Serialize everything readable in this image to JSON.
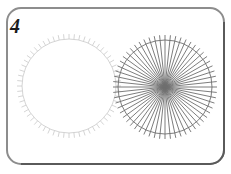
{
  "figure": {
    "label": "4",
    "width": 231,
    "height": 174,
    "background_color": "#ffffff",
    "frame": {
      "name": "rounded-rectangle-border",
      "x": 7,
      "y": 8,
      "width": 217,
      "height": 156,
      "corner_radius": 14,
      "stroke_light": "#8d8d8d",
      "stroke_dark": "#5a5a5a",
      "stroke_width": 2
    }
  },
  "chart_data": {
    "type": "scatter",
    "title": "4",
    "subtitle": "",
    "xlabel": "",
    "ylabel": "",
    "grid": false,
    "legend": "none",
    "xlim": [
      0,
      231
    ],
    "ylim": [
      0,
      174
    ],
    "series": [
      {
        "name": "left-circle-ticked-outline",
        "shape": "circle",
        "cx": 69,
        "cy": 86,
        "r": 47,
        "tick_count": 60,
        "tick_length": 5,
        "spokes": false,
        "stroke": "#c9c9c9",
        "stroke_width": 0.8,
        "fill": "none"
      },
      {
        "name": "right-circle-radial-spokes",
        "shape": "circle",
        "cx": 165,
        "cy": 87,
        "r": 47,
        "tick_count": 60,
        "tick_length": 5,
        "spokes": true,
        "spoke_count": 60,
        "stroke": "#6e6e6e",
        "stroke_width": 0.9,
        "fill": "none"
      }
    ]
  }
}
